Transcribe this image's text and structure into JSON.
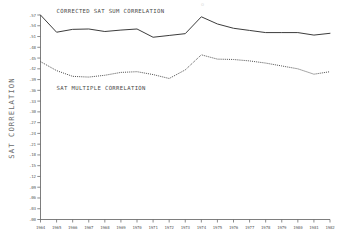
{
  "chart_data": {
    "type": "line",
    "title": "",
    "xlabel": "",
    "ylabel": "SAT CORRELATION",
    "grid": false,
    "legend_position": "inline-annotations",
    "xlim": [
      1964,
      1982
    ],
    "ylim": [
      0.0,
      0.57
    ],
    "ytick_step": 0.03,
    "x": [
      1964,
      1965,
      1966,
      1967,
      1968,
      1969,
      1970,
      1971,
      1972,
      1973,
      1974,
      1975,
      1976,
      1977,
      1978,
      1979,
      1980,
      1981,
      1982
    ],
    "xtick_labels": [
      "1964",
      "1965",
      "1966",
      "1967",
      "1968",
      "1969",
      "1970",
      "1971",
      "1972",
      "1973",
      "1974",
      "1975",
      "1976",
      "1977",
      "1978",
      "1979",
      "1980",
      "1981",
      "1982"
    ],
    "ytick_labels": [
      ".57",
      ".54",
      ".51",
      ".48",
      ".45",
      ".42",
      ".39",
      ".36",
      ".33",
      ".30",
      ".27",
      ".24",
      ".21",
      ".18",
      ".15",
      ".12",
      ".09",
      ".06",
      ".03",
      ".00"
    ],
    "ytick_values": [
      0.57,
      0.54,
      0.51,
      0.48,
      0.45,
      0.42,
      0.39,
      0.36,
      0.33,
      0.3,
      0.27,
      0.24,
      0.21,
      0.18,
      0.15,
      0.12,
      0.09,
      0.06,
      0.03,
      0.0
    ],
    "series": [
      {
        "name": "CORRECTED SAT SUM CORRELATION",
        "style": "solid",
        "color": "#3c3c3c",
        "values": [
          0.57,
          0.522,
          0.53,
          0.531,
          0.524,
          0.528,
          0.531,
          0.508,
          0.513,
          0.518,
          0.565,
          0.545,
          0.533,
          0.527,
          0.521,
          0.521,
          0.521,
          0.514,
          0.519
        ]
      },
      {
        "name": "SAT MULTIPLE CORRELATION",
        "style": "dotted",
        "color": "#4a4a4a",
        "values": [
          0.44,
          0.415,
          0.399,
          0.397,
          0.402,
          0.41,
          0.412,
          0.404,
          0.393,
          0.417,
          0.459,
          0.447,
          0.446,
          0.442,
          0.436,
          0.428,
          0.42,
          0.405,
          0.412
        ]
      }
    ],
    "annotations": [
      {
        "text": "CORRECTED SAT SUM CORRELATION",
        "x": 1965.0,
        "y": 0.575
      },
      {
        "text": "SAT MULTIPLE CORRELATION",
        "x": 1965.0,
        "y": 0.36
      }
    ]
  },
  "artifact": {
    "top_mark": "o"
  }
}
